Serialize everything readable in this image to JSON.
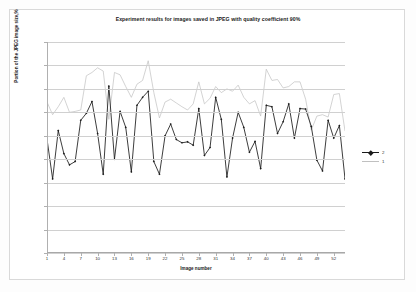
{
  "chart_data": {
    "type": "line",
    "title": "Experiment results for images saved in JPEG with quality coefficient 90%",
    "xlabel": "Image number",
    "ylabel": "Portion of the JPEG image size,%",
    "xlim": [
      1,
      54
    ],
    "ylim": [
      94.5,
      99
    ],
    "ytick_labels": [
      "99",
      "98,5",
      "98",
      "97,5",
      "97",
      "96,5",
      "96",
      "95,5",
      "95",
      "94,5"
    ],
    "ytick_values": [
      99,
      98.5,
      98,
      97.5,
      97,
      96.5,
      96,
      95.5,
      95,
      94.5
    ],
    "xtick_labels": [
      "1",
      "4",
      "7",
      "10",
      "13",
      "16",
      "19",
      "22",
      "25",
      "28",
      "31",
      "34",
      "37",
      "40",
      "43",
      "46",
      "49",
      "52"
    ],
    "xtick_values": [
      1,
      4,
      7,
      10,
      13,
      16,
      19,
      22,
      25,
      28,
      31,
      34,
      37,
      40,
      43,
      46,
      49,
      52
    ],
    "grid": true,
    "legend_position": "right",
    "x": [
      1,
      2,
      3,
      4,
      5,
      6,
      7,
      8,
      9,
      10,
      11,
      12,
      13,
      14,
      15,
      16,
      17,
      18,
      19,
      20,
      21,
      22,
      23,
      24,
      25,
      26,
      27,
      28,
      29,
      30,
      31,
      32,
      33,
      34,
      35,
      36,
      37,
      38,
      39,
      40,
      41,
      42,
      43,
      44,
      45,
      46,
      47,
      48,
      49,
      50,
      51,
      52,
      53,
      54
    ],
    "series": [
      {
        "name": "2",
        "color": "#1a1a1a",
        "marker": "diamond",
        "values": [
          96.93,
          96.08,
          97.11,
          96.62,
          96.38,
          96.45,
          97.33,
          97.48,
          97.73,
          97.05,
          96.18,
          98.06,
          96.5,
          97.52,
          97.18,
          96.23,
          97.65,
          97.82,
          97.95,
          96.45,
          96.18,
          97.0,
          97.25,
          96.92,
          96.85,
          96.87,
          96.8,
          97.58,
          96.58,
          96.75,
          97.82,
          97.35,
          96.12,
          96.95,
          97.5,
          97.18,
          96.65,
          96.88,
          96.3,
          97.65,
          97.62,
          97.05,
          97.3,
          97.68,
          96.95,
          97.58,
          97.57,
          97.2,
          96.48,
          96.25,
          97.33,
          96.95,
          97.22,
          96.08
        ]
      },
      {
        "name": "1",
        "color": "#c0c0c0",
        "marker": "none",
        "values": [
          97.72,
          97.45,
          97.62,
          97.82,
          97.5,
          97.52,
          97.55,
          98.28,
          98.35,
          98.45,
          98.38,
          97.35,
          98.35,
          98.3,
          98.05,
          97.82,
          98.1,
          98.18,
          98.6,
          97.92,
          97.38,
          97.72,
          97.78,
          97.7,
          97.62,
          97.55,
          97.68,
          98.15,
          97.68,
          97.8,
          98.05,
          97.92,
          98.0,
          97.95,
          98.08,
          97.82,
          97.68,
          97.75,
          97.42,
          98.42,
          98.18,
          98.2,
          98.02,
          98.05,
          98.15,
          98.15,
          97.78,
          97.12,
          97.42,
          97.45,
          97.4,
          97.88,
          97.9,
          97.1
        ]
      }
    ]
  },
  "legend": {
    "items": [
      {
        "label": "2"
      },
      {
        "label": "1"
      }
    ]
  }
}
